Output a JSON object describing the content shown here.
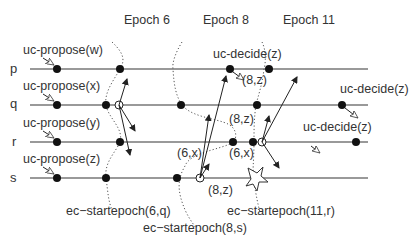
{
  "epochs": [
    {
      "label": "Epoch 6",
      "x": 148,
      "y": 24
    },
    {
      "label": "Epoch 8",
      "x": 224,
      "y": 24
    },
    {
      "label": "Epoch 11",
      "x": 298,
      "y": 24
    }
  ],
  "processes": [
    {
      "name": "p",
      "y": 69,
      "propose": "uc-propose(w)"
    },
    {
      "name": "q",
      "y": 105,
      "propose": "uc-propose(x)"
    },
    {
      "name": "r",
      "y": 142,
      "propose": "uc-propose(y)"
    },
    {
      "name": "s",
      "y": 178,
      "propose": "uc-propose(z)"
    }
  ],
  "decide_labels": {
    "p": "uc-decide(z)",
    "q": "uc-decide(z)",
    "r": "uc-decide(z)"
  },
  "message_labels": {
    "p_8z": "(8,z)",
    "q_8z": "(8,z)",
    "r_6x_left": "(6,x)",
    "r_6x_right": "(6,x)",
    "s_8z": "(8,z)"
  },
  "epoch_start_labels": {
    "e6": "ec−startepoch(6,q)",
    "e8": "ec−startepoch(8,s)",
    "e11": "ec−startepoch(11,r)"
  },
  "colors": {
    "line": "#777777",
    "event": "#111111",
    "text": "#333333"
  }
}
